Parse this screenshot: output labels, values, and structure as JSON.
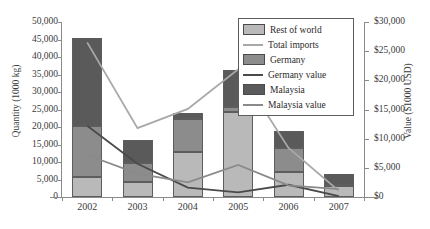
{
  "chart_data": {
    "type": "bar",
    "title": "",
    "subtitle": "",
    "categories": [
      "2002",
      "2003",
      "2004",
      "2005",
      "2006",
      "2007"
    ],
    "xlabel": "",
    "ylabel": "Quantity (1000 kg)",
    "y2label": "Value ($1000 USD)",
    "ylim": [
      0,
      50000
    ],
    "y2lim": [
      0,
      30000
    ],
    "ytick_labels": [
      "0",
      "5,000",
      "10,000",
      "15,000",
      "20,000",
      "25,000",
      "30,000",
      "35,000",
      "40,000",
      "45,000",
      "50,000"
    ],
    "ytick_values": [
      0,
      5000,
      10000,
      15000,
      20000,
      25000,
      30000,
      35000,
      40000,
      45000,
      50000
    ],
    "y2tick_labels": [
      "$0",
      "$5,000",
      "$10,000",
      "$15,000",
      "$20,000",
      "$25,000",
      "$30,000"
    ],
    "y2tick_values": [
      0,
      5000,
      10000,
      15000,
      20000,
      25000,
      30000
    ],
    "grid": false,
    "legend_position": "top-right",
    "stacked": true,
    "series": [
      {
        "name": "Rest of world",
        "kind": "bar",
        "axis": "left",
        "color": "#b9b9b9",
        "values": [
          5700,
          4400,
          12800,
          24200,
          7200,
          3100
        ]
      },
      {
        "name": "Germany",
        "kind": "bar",
        "axis": "left",
        "color": "#8c8c8c",
        "values": [
          14700,
          5200,
          9500,
          1400,
          6800,
          300
        ]
      },
      {
        "name": "Malaysia",
        "kind": "bar",
        "axis": "left",
        "color": "#5a5a5a",
        "values": [
          24900,
          6700,
          1800,
          10600,
          4900,
          3300
        ]
      },
      {
        "name": "Total imports",
        "kind": "line",
        "axis": "right",
        "color": "#a8a8a8",
        "values": [
          26500,
          11800,
          15100,
          21900,
          8400,
          1050
        ]
      },
      {
        "name": "Germany value",
        "kind": "line",
        "axis": "right",
        "color": "#4a4a4a",
        "values": [
          12200,
          5700,
          1600,
          800,
          2100,
          150
        ]
      },
      {
        "name": "Malaysia value",
        "kind": "line",
        "axis": "right",
        "color": "#8a8a8a",
        "values": [
          7200,
          4000,
          2500,
          5500,
          2000,
          1350
        ]
      }
    ],
    "legend_entries": [
      {
        "label": "Rest of world",
        "type": "swatch",
        "color": "#b9b9b9"
      },
      {
        "label": "Total imports",
        "type": "line",
        "color": "#a8a8a8"
      },
      {
        "label": "Germany",
        "type": "swatch",
        "color": "#8c8c8c"
      },
      {
        "label": "Germany value",
        "type": "line",
        "color": "#4a4a4a"
      },
      {
        "label": "Malaysia",
        "type": "swatch",
        "color": "#5a5a5a"
      },
      {
        "label": "Malaysia value",
        "type": "line",
        "color": "#8a8a8a"
      }
    ]
  }
}
